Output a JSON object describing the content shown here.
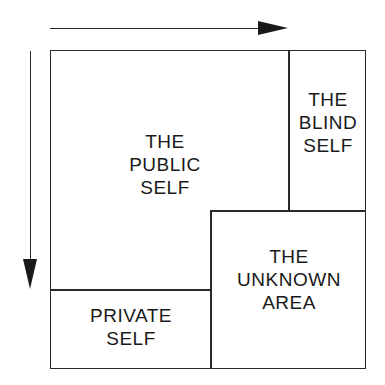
{
  "diagram": {
    "regions": {
      "public": {
        "lines": [
          "THE",
          "PUBLIC",
          "SELF"
        ]
      },
      "blind": {
        "lines": [
          "THE",
          "BLIND",
          "SELF"
        ]
      },
      "unknown": {
        "lines": [
          "THE",
          "UNKNOWN",
          "AREA"
        ]
      },
      "private": {
        "lines": [
          "PRIVATE",
          "SELF"
        ]
      }
    },
    "arrows": {
      "horizontal": "right",
      "vertical": "down"
    },
    "colors": {
      "line": "#2a2a2a",
      "background": "#ffffff"
    }
  }
}
